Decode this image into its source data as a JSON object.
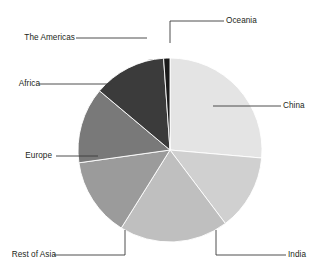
{
  "chart_data": {
    "type": "pie",
    "title": "",
    "subtitle": "",
    "xlabel": "",
    "ylabel": "",
    "legend_position": "none",
    "grid": false,
    "labels_inline": true,
    "start_angle_deg": 0,
    "direction": "clockwise",
    "categories": [
      "China",
      "India",
      "Rest of Asia",
      "Europe",
      "Africa",
      "The Americas",
      "Oceania"
    ],
    "values": [
      26.4,
      13.3,
      19.2,
      13.9,
      13.3,
      12.8,
      1.1
    ],
    "unit": "percent",
    "slices": [
      {
        "label": "China",
        "value": 26.4,
        "start_deg": 0.0,
        "end_deg": 95.0,
        "color": "#e4e4e4"
      },
      {
        "label": "India",
        "value": 13.3,
        "start_deg": 95.0,
        "end_deg": 143.0,
        "color": "#d0d0d0"
      },
      {
        "label": "Rest of Asia",
        "value": 19.2,
        "start_deg": 143.0,
        "end_deg": 212.0,
        "color": "#bfbfbf"
      },
      {
        "label": "Europe",
        "value": 13.9,
        "start_deg": 212.0,
        "end_deg": 262.0,
        "color": "#9b9b9b"
      },
      {
        "label": "Africa",
        "value": 13.3,
        "start_deg": 262.0,
        "end_deg": 310.0,
        "color": "#797979"
      },
      {
        "label": "The Americas",
        "value": 12.8,
        "start_deg": 310.0,
        "end_deg": 356.0,
        "color": "#3b3b3b"
      },
      {
        "label": "Oceania",
        "value": 1.1,
        "start_deg": 356.0,
        "end_deg": 360.0,
        "color": "#1a1a1a"
      }
    ],
    "geometry": {
      "cx": 170,
      "cy": 150,
      "r": 92
    },
    "leader_line_color": "#3a3a3a",
    "background_color": "#ffffff",
    "text_color": "#231f20"
  },
  "labels": {
    "oceania": "Oceania",
    "china": "China",
    "india": "India",
    "rest_of_asia": "Rest of Asia",
    "europe": "Europe",
    "africa": "Africa",
    "the_americas": "The Americas"
  }
}
